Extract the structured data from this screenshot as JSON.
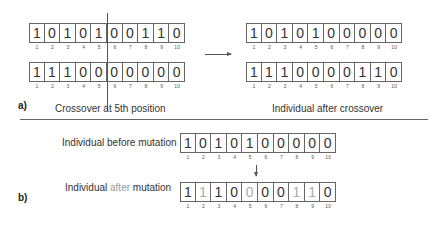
{
  "figure": {
    "section_a": {
      "tag": "a)",
      "caption_left": "Crossover at 5th position",
      "caption_right": "Individual after crossover",
      "crossover_point": 5,
      "parents": [
        {
          "bits": [
            "1",
            "0",
            "1",
            "0",
            "1",
            "0",
            "0",
            "1",
            "1",
            "0"
          ]
        },
        {
          "bits": [
            "1",
            "1",
            "1",
            "0",
            "0",
            "0",
            "0",
            "0",
            "0",
            "0"
          ]
        }
      ],
      "offspring": [
        {
          "bits": [
            "1",
            "0",
            "1",
            "0",
            "1",
            "0",
            "0",
            "0",
            "0",
            "0"
          ]
        },
        {
          "bits": [
            "1",
            "1",
            "1",
            "0",
            "0",
            "0",
            "0",
            "1",
            "1",
            "0"
          ]
        }
      ]
    },
    "section_b": {
      "tag": "b)",
      "before_label": "Individual before mutation",
      "after_label_prefix": "Individual ",
      "after_label_highlight": "after",
      "after_label_suffix": " mutation",
      "before": {
        "bits": [
          "1",
          "0",
          "1",
          "0",
          "1",
          "0",
          "0",
          "0",
          "0",
          "0"
        ]
      },
      "after": {
        "bits": [
          "1",
          "1",
          "1",
          "0",
          "0",
          "0",
          "0",
          "1",
          "1",
          "0"
        ],
        "mutated_positions": [
          2,
          5,
          8,
          9
        ]
      }
    },
    "indices": [
      "1",
      "2",
      "3",
      "4",
      "5",
      "6",
      "7",
      "8",
      "9",
      "10"
    ],
    "colors": {
      "line": "#666666",
      "text": "#333333",
      "muted": "#aaaaaa"
    }
  }
}
